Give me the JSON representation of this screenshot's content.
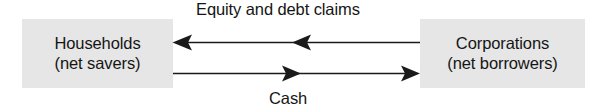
{
  "diagram": {
    "title_label": "Equity and debt claims",
    "bottom_label": "Cash",
    "background_color": "#ffffff",
    "box_fill_color": "#e6e6e6",
    "line_color": "#1a1a1a",
    "entities": [
      {
        "id": "households",
        "line1": "Households",
        "line2": "(net savers)",
        "role": "net savers"
      },
      {
        "id": "corporations",
        "line1": "Corporations",
        "line2": "(net borrowers)",
        "role": "net borrowers"
      }
    ],
    "flows": [
      {
        "id": "equity-debt-claims",
        "label": "Equity and debt claims",
        "direction": "corporations-to-households",
        "arrowhead_count": 2
      },
      {
        "id": "cash",
        "label": "Cash",
        "direction": "households-to-corporations",
        "arrowhead_count": 2
      }
    ]
  }
}
